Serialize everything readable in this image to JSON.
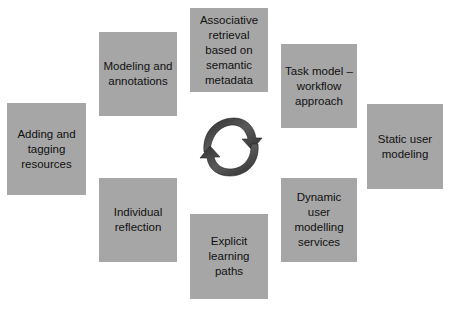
{
  "diagram": {
    "type": "cycle",
    "center_icon": "circular-arrows-icon",
    "colors": {
      "box_fill": "#a6a6a6",
      "text": "#111111",
      "arrow": "#404040",
      "background": "#ffffff"
    },
    "nodes": [
      {
        "id": "top",
        "label": "Associative retrieval based on semantic metadata"
      },
      {
        "id": "top-right",
        "label": "Task model – workflow approach"
      },
      {
        "id": "right",
        "label": "Static user modeling"
      },
      {
        "id": "bottom-right",
        "label": "Dynamic user modelling services"
      },
      {
        "id": "bottom",
        "label": "Explicit learning paths"
      },
      {
        "id": "bottom-left",
        "label": "Individual reflection"
      },
      {
        "id": "left",
        "label": "Adding and tagging resources"
      },
      {
        "id": "top-left",
        "label": "Modeling and annotations"
      }
    ]
  }
}
